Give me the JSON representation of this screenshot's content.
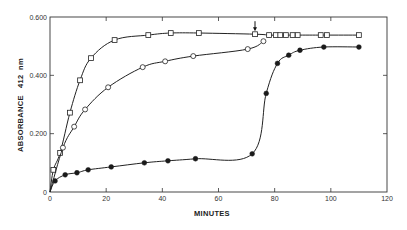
{
  "chart_data": {
    "type": "line",
    "title": "",
    "xlabel": "MINUTES",
    "ylabel": "ABSORBANCE   412  nm",
    "xlim": [
      0,
      120
    ],
    "ylim": [
      0,
      0.6
    ],
    "x_ticks": [
      0,
      20,
      40,
      60,
      80,
      100,
      120
    ],
    "x_tick_labels": [
      "0",
      "20",
      "40",
      "60",
      "80",
      "100",
      "120"
    ],
    "y_ticks": [
      0,
      0.2,
      0.4,
      0.6
    ],
    "y_tick_labels": [
      "0",
      "0.200",
      "0.400",
      "0.600"
    ],
    "grid": false,
    "legend": "none",
    "annotations": [
      {
        "type": "arrow",
        "x": 73,
        "y": 0.541,
        "direction": "down",
        "text": ""
      }
    ],
    "series": [
      {
        "name": "open squares",
        "marker": "square-open",
        "x": [
          0,
          1.2,
          3.6,
          7.1,
          10.7,
          14.6,
          23,
          35,
          43,
          53,
          73,
          78,
          80.4,
          82,
          84,
          86.4,
          88.2,
          96.4,
          98.6,
          110
        ],
        "y": [
          0,
          0.076,
          0.134,
          0.272,
          0.383,
          0.459,
          0.521,
          0.538,
          0.545,
          0.545,
          0.541,
          0.538,
          0.538,
          0.538,
          0.538,
          0.538,
          0.538,
          0.538,
          0.538,
          0.538
        ]
      },
      {
        "name": "open circles",
        "marker": "circle-open",
        "x": [
          0,
          4.6,
          8.6,
          12.5,
          20.7,
          33,
          41,
          51,
          70.4,
          76
        ],
        "y": [
          0,
          0.152,
          0.224,
          0.283,
          0.359,
          0.428,
          0.448,
          0.466,
          0.49,
          0.517
        ]
      },
      {
        "name": "filled circles",
        "marker": "circle-filled",
        "x": [
          0,
          1.8,
          5.4,
          9.6,
          13.6,
          21.8,
          33.6,
          42,
          51.8,
          72,
          77,
          81,
          85,
          89,
          97.5,
          110
        ],
        "y": [
          0,
          0.038,
          0.059,
          0.066,
          0.076,
          0.086,
          0.1,
          0.107,
          0.114,
          0.131,
          0.338,
          0.441,
          0.469,
          0.486,
          0.497,
          0.497
        ]
      }
    ]
  }
}
